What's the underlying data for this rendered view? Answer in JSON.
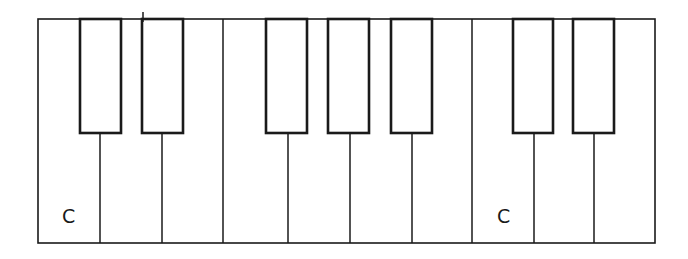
{
  "diagram": {
    "type": "piano-keyboard",
    "stroke_color": "#1a1a1a",
    "white_keys": [
      {
        "note": "C",
        "x0": 38,
        "x1": 100
      },
      {
        "note": "D",
        "x0": 100,
        "x1": 162
      },
      {
        "note": "E",
        "x0": 162,
        "x1": 223
      },
      {
        "note": "F",
        "x0": 223,
        "x1": 288
      },
      {
        "note": "G",
        "x0": 288,
        "x1": 350
      },
      {
        "note": "A",
        "x0": 350,
        "x1": 412
      },
      {
        "note": "B",
        "x0": 412,
        "x1": 472
      },
      {
        "note": "C",
        "x0": 472,
        "x1": 534
      },
      {
        "note": "D",
        "x0": 534,
        "x1": 594
      },
      {
        "note": "E",
        "x0": 594,
        "x1": 655
      }
    ],
    "black_keys": [
      {
        "x0": 80,
        "x1": 121
      },
      {
        "x0": 142,
        "x1": 183
      },
      {
        "x0": 266,
        "x1": 307
      },
      {
        "x0": 328,
        "x1": 369
      },
      {
        "x0": 391,
        "x1": 432
      },
      {
        "x0": 513,
        "x1": 553
      },
      {
        "x0": 573,
        "x1": 614
      }
    ],
    "labels": [
      {
        "text": "C",
        "x": 62,
        "y": 205
      },
      {
        "text": "C",
        "x": 497,
        "y": 205
      }
    ]
  }
}
